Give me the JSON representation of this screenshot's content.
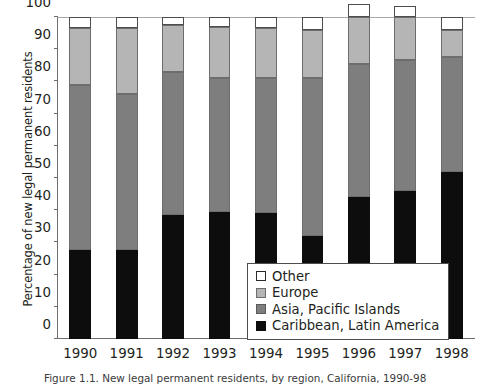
{
  "chart_data": {
    "type": "bar",
    "subtype": "stacked-vertical-100",
    "title": "",
    "xlabel": "",
    "ylabel": "Percentage of new legal permanent residents",
    "ylim": [
      0,
      100
    ],
    "yticks": [
      0,
      10,
      20,
      30,
      40,
      50,
      60,
      70,
      80,
      90,
      100
    ],
    "ytick_labels": [
      "0",
      "10",
      "20",
      "30",
      "40",
      "50",
      "60",
      "70",
      "80",
      "90",
      "100"
    ],
    "grid": false,
    "legend_position": "inside-lower-right",
    "categories": [
      "1990",
      "1991",
      "1992",
      "1993",
      "1994",
      "1995",
      "1996",
      "1997",
      "1998"
    ],
    "series": [
      {
        "name": "Caribbean, Latin America",
        "color": "#0d0d0d",
        "values": [
          27.5,
          27.5,
          38.5,
          39.5,
          39,
          32,
          44,
          46,
          52
        ]
      },
      {
        "name": "Asia, Pacific Islands",
        "color": "#7e7e7e",
        "values": [
          51.5,
          48.5,
          44.5,
          41.5,
          42,
          49,
          41.5,
          40.5,
          35.5
        ]
      },
      {
        "name": "Europe",
        "color": "#b5b5b5",
        "values": [
          17.5,
          20.5,
          14.5,
          16,
          15.5,
          15,
          14.5,
          13.5,
          8.5
        ]
      },
      {
        "name": "Other",
        "color": "#ffffff",
        "values": [
          3.5,
          3.5,
          2.5,
          3,
          3.5,
          4,
          4,
          3.5,
          4
        ]
      }
    ],
    "cumulative_tops": {
      "caribbean": [
        27.5,
        27.5,
        38.5,
        39.5,
        39,
        32,
        44,
        46,
        52
      ],
      "asia": [
        79,
        76,
        83,
        81,
        81,
        81,
        85.5,
        86.5,
        87.5
      ],
      "europe": [
        96.5,
        96.5,
        97.5,
        97,
        96.5,
        96,
        100,
        100,
        96
      ],
      "other": [
        100,
        100,
        100,
        100,
        100,
        100,
        100,
        100,
        100
      ]
    }
  },
  "legend": {
    "items": [
      {
        "label": "Other",
        "swatch": "sw-other"
      },
      {
        "label": "Europe",
        "swatch": "sw-europe"
      },
      {
        "label": "Asia, Pacific Islands",
        "swatch": "sw-asia"
      },
      {
        "label": "Caribbean, Latin America",
        "swatch": "sw-caribbean"
      }
    ]
  },
  "caption": {
    "text": "Figure 1.1. New legal permanent residents, by region, California, 1990-98"
  }
}
